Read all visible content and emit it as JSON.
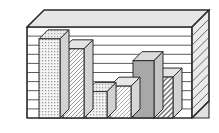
{
  "figure": {
    "kind": "3d-bar-chart-illustration",
    "background_color": "#ffffff",
    "outline_color": "#2b2b2b",
    "wall_fill": "#ffffff",
    "top_slab_fill": "#e6e6e6",
    "side_slab_fill": "#d8d8d8",
    "floor_fill": "#f2f2f2"
  },
  "chart_data": {
    "type": "bar",
    "title": "",
    "subtitle": "",
    "xlabel": "",
    "ylabel": "",
    "grid": true,
    "gridlines": 9,
    "legend_position": "none",
    "axis_tick_labels_visible": false,
    "ylim": [
      0,
      10
    ],
    "categories": [
      "1",
      "2",
      "3",
      "4",
      "5",
      "6"
    ],
    "values": [
      8.7,
      7.6,
      2.9,
      3.5,
      6.3,
      4.5
    ],
    "series": [
      {
        "name": "bars",
        "values": [
          8.7,
          7.6,
          2.9,
          3.5,
          6.3,
          4.5
        ]
      }
    ],
    "bars": [
      {
        "index": 1,
        "category": "1",
        "value": 8.7,
        "fill_pattern": "fine-dots",
        "fill_color": "#efefef",
        "top_face_color": "#e4e4e4",
        "side_face_color": "#d2d2d2"
      },
      {
        "index": 2,
        "category": "2",
        "value": 7.6,
        "fill_pattern": "diagonal-hatch-forward",
        "fill_color": "#f4f4f4",
        "top_face_color": "#e4e4e4",
        "side_face_color": "#d2d2d2"
      },
      {
        "index": 3,
        "category": "3",
        "value": 2.9,
        "fill_pattern": "fine-dots",
        "fill_color": "#ededed",
        "top_face_color": "#e4e4e4",
        "side_face_color": "#d2d2d2"
      },
      {
        "index": 4,
        "category": "4",
        "value": 3.5,
        "fill_pattern": "diagonal-hatch-forward",
        "fill_color": "#f4f4f4",
        "top_face_color": "#e8e8e8",
        "side_face_color": "#d6d6d6"
      },
      {
        "index": 5,
        "category": "5",
        "value": 6.3,
        "fill_pattern": "solid-gray",
        "fill_color": "#a8a8a8",
        "top_face_color": "#dcdcdc",
        "side_face_color": "#c4c4c4"
      },
      {
        "index": 6,
        "category": "6",
        "value": 4.5,
        "fill_pattern": "diagonal-hatch-forward-bold",
        "fill_color": "#f0f0f0",
        "top_face_color": "#e4e4e4",
        "side_face_color": "#d2d2d2"
      }
    ]
  }
}
